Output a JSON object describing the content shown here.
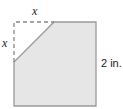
{
  "diagram": {
    "labels": {
      "top_x": "x",
      "left_x": "x",
      "side": "2 in."
    },
    "colors": {
      "fill": "#e6e6e6",
      "stroke": "#9a9a9a",
      "dash": "#888888"
    }
  }
}
